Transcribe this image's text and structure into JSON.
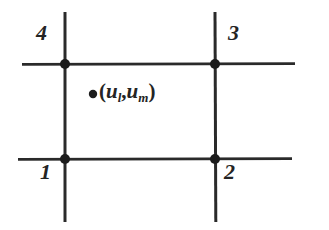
{
  "figure": {
    "width": 329,
    "height": 230,
    "background_color": "#ffffff",
    "stroke_color": "#2a2a2a",
    "node_color": "#1c1c1c"
  },
  "corner_labels": [
    {
      "id": "node-1",
      "text": "1",
      "corner": "bottom-left",
      "x": 40,
      "y": 162
    },
    {
      "id": "node-2",
      "text": "2",
      "corner": "bottom-right",
      "x": 224,
      "y": 162
    },
    {
      "id": "node-3",
      "text": "3",
      "corner": "top-right",
      "x": 228,
      "y": 33
    },
    {
      "id": "node-4",
      "text": "4",
      "corner": "top-left",
      "x": 36,
      "y": 33
    }
  ],
  "interior_point": {
    "marker_x": 93,
    "marker_y": 94,
    "label_x": 100,
    "label_y": 80,
    "open_paren": "(",
    "var1_base": "u",
    "var1_sub": "l",
    "comma": ",",
    "var2_base": "u",
    "var2_sub": "m",
    "close_paren": ")",
    "plain_text": "(u_l, u_m)"
  },
  "lines": {
    "vertical_left": {
      "x": 65,
      "y1": 12,
      "y2": 222
    },
    "vertical_right": {
      "x": 215,
      "y1": 12,
      "y2": 222
    },
    "horizontal_top": {
      "y": 64,
      "x1": 22,
      "x2": 295
    },
    "horizontal_bottom": {
      "y": 159,
      "x1": 18,
      "x2": 292
    }
  },
  "nodes": [
    {
      "id": "node-dot-4",
      "x": 65,
      "y": 64
    },
    {
      "id": "node-dot-3",
      "x": 215,
      "y": 64
    },
    {
      "id": "node-dot-1",
      "x": 65,
      "y": 159
    },
    {
      "id": "node-dot-2",
      "x": 215,
      "y": 159
    }
  ]
}
